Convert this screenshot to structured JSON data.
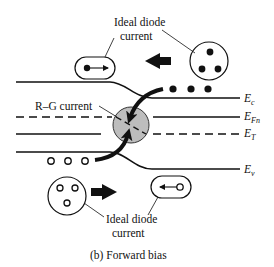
{
  "diagram": {
    "caption": "(b) Forward bias",
    "labels": {
      "ideal_top_line1": "Ideal diode",
      "ideal_top_line2": "current",
      "ideal_bottom_line1": "Ideal diode",
      "ideal_bottom_line2": "current",
      "rg_current": "R–G current"
    },
    "bands": [
      {
        "id": "Ec",
        "main": "E",
        "sub": "c"
      },
      {
        "id": "EFn",
        "main": "E",
        "sub": "Fn"
      },
      {
        "id": "ET",
        "main": "E",
        "sub": "T"
      },
      {
        "id": "Ev",
        "main": "E",
        "sub": "v"
      }
    ],
    "colors": {
      "line": "#111111",
      "rg_fill": "#bdbdbd",
      "background": "#ffffff"
    }
  }
}
